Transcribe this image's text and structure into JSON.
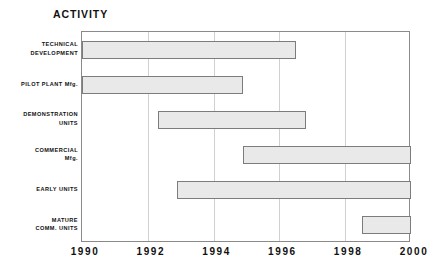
{
  "chart_data": {
    "type": "bar",
    "title": "ACTIVITY",
    "orientation": "horizontal",
    "subtype": "gantt",
    "xlabel": "",
    "ylabel": "",
    "xlim": [
      1990,
      2000
    ],
    "xticks": [
      1990,
      1992,
      1994,
      1996,
      1998,
      2000
    ],
    "xtick_labels": [
      "1990",
      "1992",
      "1994",
      "1996",
      "1998",
      "2000"
    ],
    "grid": true,
    "grid_axis": "x",
    "legend": "none",
    "categories": [
      "TECHNICAL DEVELOPMENT",
      "PILOT PLANT Mfg.",
      "DEMONSTRATION UNITS",
      "COMMERCIAL Mfg.",
      "EARLY UNITS",
      "MATURE COMM. UNITS"
    ],
    "bars": [
      {
        "label_line1": "TECHNICAL",
        "label_line2": "DEVELOPMENT",
        "start": 1990.0,
        "end": 1996.5
      },
      {
        "label_line1": "PILOT PLANT Mfg.",
        "label_line2": "",
        "start": 1990.0,
        "end": 1994.9
      },
      {
        "label_line1": "DEMONSTRATION",
        "label_line2": "UNITS",
        "start": 1992.3,
        "end": 1996.8
      },
      {
        "label_line1": "COMMERCIAL",
        "label_line2": "Mfg.",
        "start": 1994.9,
        "end": 2000.0
      },
      {
        "label_line1": "EARLY UNITS",
        "label_line2": "",
        "start": 1992.9,
        "end": 2000.0
      },
      {
        "label_line1": "MATURE",
        "label_line2": "COMM. UNITS",
        "start": 1998.5,
        "end": 2000.0
      }
    ],
    "colors": {
      "bar_fill": "#e9e9e9",
      "bar_border": "#7c7c7c",
      "axis": "#8a8a8a",
      "grid": "#d0d0d0",
      "text": "#111111",
      "background": "#ffffff"
    }
  }
}
